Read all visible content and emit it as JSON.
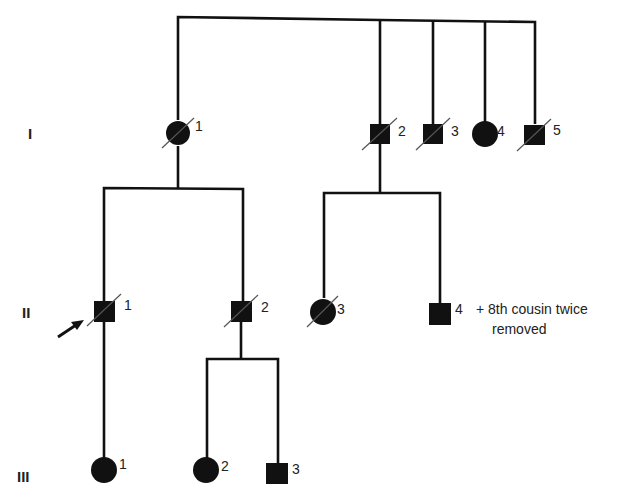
{
  "diagram": {
    "type": "pedigree",
    "generations": [
      {
        "label": "I",
        "y": 133
      },
      {
        "label": "II",
        "y": 311
      },
      {
        "label": "III",
        "y": 470
      }
    ],
    "individuals": [
      {
        "id": "I-1",
        "gen": "I",
        "num": "1",
        "sex": "female",
        "affected": true,
        "deceased": true,
        "x": 178,
        "y": 133
      },
      {
        "id": "I-2",
        "gen": "I",
        "num": "2",
        "sex": "male",
        "affected": true,
        "deceased": true,
        "x": 380,
        "y": 133
      },
      {
        "id": "I-3",
        "gen": "I",
        "num": "3",
        "sex": "male",
        "affected": true,
        "deceased": true,
        "x": 433,
        "y": 133
      },
      {
        "id": "I-4",
        "gen": "I",
        "num": "4",
        "sex": "female",
        "affected": true,
        "deceased": false,
        "x": 484,
        "y": 133
      },
      {
        "id": "I-5",
        "gen": "I",
        "num": "5",
        "sex": "male",
        "affected": true,
        "deceased": true,
        "x": 535,
        "y": 133
      },
      {
        "id": "II-1",
        "gen": "II",
        "num": "1",
        "sex": "male",
        "affected": true,
        "deceased": true,
        "proband": true,
        "x": 104,
        "y": 311
      },
      {
        "id": "II-2",
        "gen": "II",
        "num": "2",
        "sex": "male",
        "affected": true,
        "deceased": true,
        "x": 241,
        "y": 311
      },
      {
        "id": "II-3",
        "gen": "II",
        "num": "3",
        "sex": "female",
        "affected": true,
        "deceased": true,
        "x": 323,
        "y": 311
      },
      {
        "id": "II-4",
        "gen": "II",
        "num": "4",
        "sex": "male",
        "affected": true,
        "deceased": false,
        "x": 440,
        "y": 313
      },
      {
        "id": "III-1",
        "gen": "III",
        "num": "1",
        "sex": "female",
        "affected": true,
        "deceased": false,
        "x": 104,
        "y": 470
      },
      {
        "id": "III-2",
        "gen": "III",
        "num": "2",
        "sex": "female",
        "affected": true,
        "deceased": false,
        "x": 206,
        "y": 470
      },
      {
        "id": "III-3",
        "gen": "III",
        "num": "3",
        "sex": "male",
        "affected": true,
        "deceased": false,
        "x": 277,
        "y": 473
      }
    ],
    "annotation": {
      "line1": "+ 8th cousin twice",
      "line2": "removed",
      "attached_to": "II-4"
    },
    "proband_arrow": {
      "target": "II-1"
    }
  }
}
